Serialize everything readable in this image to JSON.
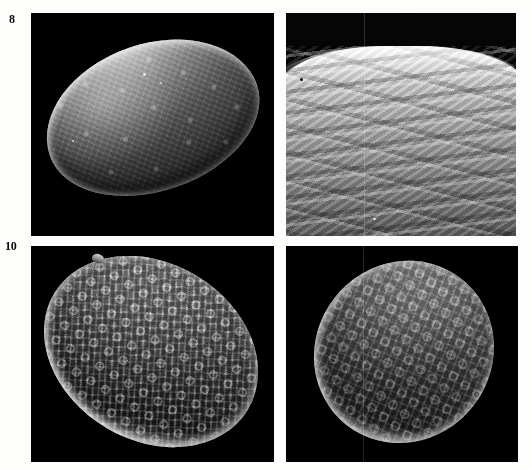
{
  "plate": {
    "kind": "sem-micrograph-plate",
    "width": 531,
    "height": 470,
    "background_color": "#fdfdfb",
    "panel_background_color": "#000000",
    "rows": 2,
    "columns": 2,
    "caption_present": false
  },
  "labels": [
    {
      "id": "label-8",
      "text": "8"
    },
    {
      "id": "label-10",
      "text": "10"
    }
  ],
  "panels": [
    {
      "id": "panel-tl",
      "position": "top-left",
      "figure_label": "8",
      "subject": "whole spore, lateral view",
      "ornamentation": "rugulate",
      "orientation_deg": -19,
      "background_color": "#000000",
      "has_label": true
    },
    {
      "id": "panel-tr",
      "position": "top-right",
      "figure_label": "",
      "subject": "exine surface detail, high magnification",
      "ornamentation": "anastomosing ridges",
      "orientation_deg": 0,
      "background_color": "#050505",
      "has_label": false
    },
    {
      "id": "panel-bl",
      "position": "bottom-left",
      "figure_label": "10",
      "subject": "whole spore, proximal view",
      "ornamentation": "coarsely reticulate",
      "orientation_deg": 31,
      "background_color": "#000000",
      "has_label": true
    },
    {
      "id": "panel-br",
      "position": "bottom-right",
      "figure_label": "",
      "subject": "whole spore, oblique view",
      "ornamentation": "reticulate-rugulate",
      "orientation_deg": 38,
      "background_color": "#000000",
      "has_label": false
    }
  ]
}
